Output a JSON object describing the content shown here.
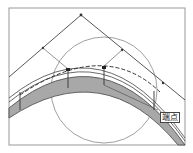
{
  "diagram": {
    "type": "cad-arc-segment-drawing",
    "snap_tooltip": "端点",
    "colors": {
      "frame": "#999999",
      "line": "#444444",
      "band_fill": "#a8a8a8",
      "circle": "#777777",
      "background": "#ffffff"
    }
  }
}
